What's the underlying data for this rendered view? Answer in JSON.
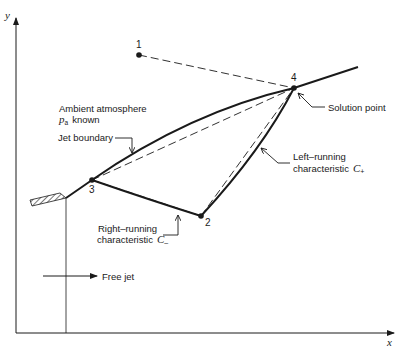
{
  "diagram": {
    "type": "method-of-characteristics free-jet boundary diagram",
    "axes": {
      "x_label": "x",
      "y_label": "y"
    },
    "points": [
      {
        "id": "1",
        "label": "1"
      },
      {
        "id": "2",
        "label": "2"
      },
      {
        "id": "3",
        "label": "3"
      },
      {
        "id": "4",
        "label": "4"
      }
    ],
    "labels": {
      "ambient_line1": "Ambient atmosphere",
      "ambient_p": "p",
      "ambient_sub": "a",
      "ambient_known": "known",
      "jet_boundary": "Jet boundary",
      "solution_point": "Solution point",
      "left_running_line1": "Left–running",
      "left_running_line2": "characteristic",
      "left_running_symbol": "C",
      "left_running_sub": "+",
      "right_running_line1": "Right–running",
      "right_running_line2": "characteristic",
      "right_running_symbol": "C",
      "right_running_sub": "–",
      "free_jet": "Free jet"
    },
    "colors": {
      "ink": "#1a1a1a",
      "background": "#ffffff"
    }
  }
}
